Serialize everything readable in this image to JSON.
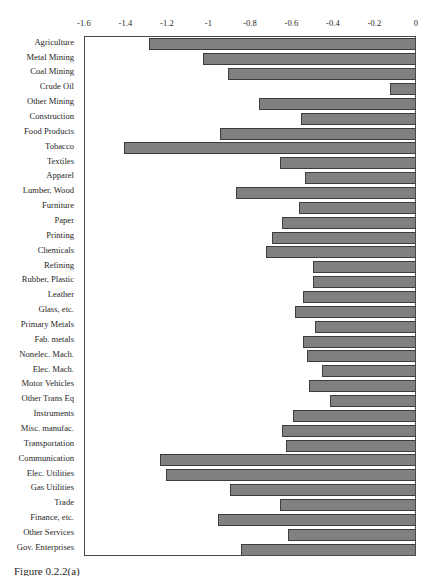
{
  "figure": {
    "caption": "Figure 0.2.2(a)"
  },
  "chart_data": {
    "type": "bar",
    "orientation": "horizontal",
    "title": "",
    "xlabel": "",
    "ylabel": "",
    "xlim": [
      -1.6,
      0
    ],
    "xticks": [
      -1.6,
      -1.4,
      -1.2,
      -1,
      -0.8,
      -0.6,
      -0.4,
      -0.2,
      0
    ],
    "xtick_labels": [
      "-1.6",
      "-1.4",
      "-1.2",
      "-1",
      "-0.8",
      "-0.6",
      "-0.4",
      "-0.2",
      "0"
    ],
    "grid": false,
    "legend": false,
    "bar_color": "#808080",
    "bar_edge_color": "#3d3d3d",
    "axis_color": "#4a4a4a",
    "categories": [
      "Agriculture",
      "Metal Mining",
      "Coal Mining",
      "Crude Oil",
      "Other Mining",
      "Construction",
      "Food Products",
      "Tobacco",
      "Textiles",
      "Apparel",
      "Lumber, Wood",
      "Furniture",
      "Paper",
      "Printing",
      "Chemicals",
      "Refining",
      "Rubber, Plastic",
      "Leather",
      "Glass, etc.",
      "Primary Metals",
      "Fab. metals",
      "Nonelec. Mach.",
      "Elec. Mach.",
      "Motor Vehicles",
      "Other Trans Eq",
      "Instruments",
      "Misc. manufac.",
      "Transportation",
      "Communication",
      "Elec. Utilities",
      "Gas Utilities",
      "Trade",
      "Finance, etc.",
      "Other Services",
      "Gov. Enterprises"
    ],
    "values": [
      -1.29,
      -1.03,
      -0.91,
      -0.13,
      -0.76,
      -0.56,
      -0.95,
      -1.41,
      -0.66,
      -0.54,
      -0.87,
      -0.57,
      -0.65,
      -0.7,
      -0.73,
      -0.5,
      -0.5,
      -0.55,
      -0.59,
      -0.49,
      -0.55,
      -0.53,
      -0.46,
      -0.52,
      -0.42,
      -0.6,
      -0.65,
      -0.63,
      -1.24,
      -1.21,
      -0.9,
      -0.66,
      -0.96,
      -0.62,
      -0.85
    ]
  }
}
